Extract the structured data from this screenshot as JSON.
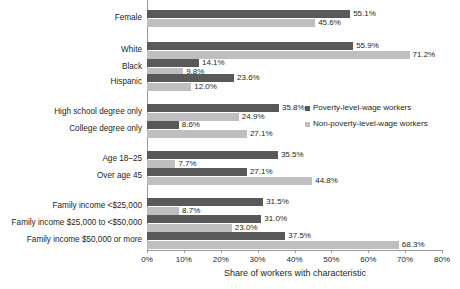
{
  "chart_data": {
    "type": "bar",
    "orientation": "horizontal",
    "title": "",
    "xlabel": "Share of workers with characteristic",
    "ylabel": "",
    "xlim": [
      0,
      80
    ],
    "xtick_labels": [
      "0%",
      "10%",
      "20%",
      "30%",
      "40%",
      "50%",
      "60%",
      "70%",
      "80%"
    ],
    "xticks": [
      0,
      10,
      20,
      30,
      40,
      50,
      60,
      70,
      80
    ],
    "grid": false,
    "legend_position": "right",
    "series": [
      {
        "name": "Poverty-level-wage workers",
        "color": "#595959",
        "values": [
          55.1,
          55.9,
          14.1,
          23.6,
          35.8,
          8.6,
          35.5,
          27.1,
          31.5,
          31.0,
          37.5
        ]
      },
      {
        "name": "Non-poverty-level-wage workers",
        "color": "#bfbfbf",
        "values": [
          45.6,
          71.2,
          9.8,
          12.0,
          24.9,
          27.1,
          7.7,
          44.8,
          8.7,
          23.0,
          68.3
        ]
      }
    ],
    "categories": [
      "Female",
      "White",
      "Black",
      "Hispanic",
      "High school degree only",
      "College degree only",
      "Age 18–25",
      "Over age 45",
      "Family income <$25,000",
      "Family income $25,000 to <$50,000",
      "Family income $50,000 or more"
    ],
    "value_labels": {
      "poverty": [
        "55.1%",
        "55.9%",
        "14.1%",
        "23.6%",
        "35.8%",
        "8.6%",
        "35.5%",
        "27.1%",
        "31.5%",
        "31.0%",
        "37.5%"
      ],
      "nonpoverty": [
        "45.6%",
        "71.2%",
        "9.8%",
        "12.0%",
        "24.9%",
        "27.1%",
        "7.7%",
        "44.8%",
        "8.7%",
        "23.0%",
        "68.3%"
      ]
    }
  },
  "legend": {
    "items": [
      {
        "label": "Poverty-level-wage workers",
        "color": "#595959"
      },
      {
        "label": "Non-poverty-level-wage workers",
        "color": "#bfbfbf"
      }
    ]
  }
}
